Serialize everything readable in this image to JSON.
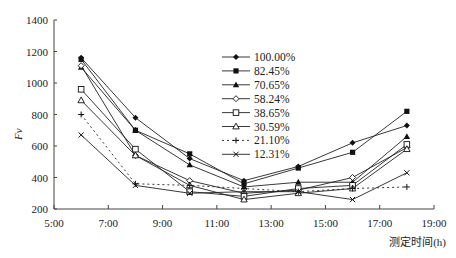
{
  "chart_data": {
    "type": "line",
    "title": "",
    "xlabel": "测定时间(h)",
    "ylabel": "Fv",
    "x_tick_labels": [
      "5:00",
      "7:00",
      "9:00",
      "11:00",
      "13:00",
      "15:00",
      "17:00",
      "19:00"
    ],
    "x_ticks_hours": [
      5,
      7,
      9,
      11,
      13,
      15,
      17,
      19
    ],
    "y_tick_labels": [
      "200",
      "400",
      "600",
      "800",
      "1000",
      "1200",
      "1400"
    ],
    "y_ticks": [
      200,
      400,
      600,
      800,
      1000,
      1200,
      1400
    ],
    "xlim": [
      5,
      19
    ],
    "ylim": [
      200,
      1400
    ],
    "grid": false,
    "legend_position": "upper-center",
    "x": [
      6,
      8,
      10,
      12,
      14,
      16,
      18
    ],
    "x_labels": [
      "6:00",
      "8:00",
      "10:00",
      "12:00",
      "14:00",
      "16:00",
      "18:00"
    ],
    "series": [
      {
        "name": "100.00%",
        "marker": "filled-diamond",
        "dash": "solid",
        "values": [
          1160,
          780,
          520,
          380,
          470,
          620,
          730
        ]
      },
      {
        "name": "82.45%",
        "marker": "filled-square",
        "dash": "solid",
        "values": [
          1150,
          700,
          550,
          360,
          460,
          560,
          820
        ]
      },
      {
        "name": "70.65%",
        "marker": "filled-triangle",
        "dash": "solid",
        "values": [
          1100,
          700,
          480,
          340,
          370,
          370,
          660
        ]
      },
      {
        "name": "58.24%",
        "marker": "open-diamond",
        "dash": "solid",
        "values": [
          1110,
          540,
          380,
          300,
          320,
          400,
          590
        ]
      },
      {
        "name": "38.65%",
        "marker": "open-square",
        "dash": "solid",
        "values": [
          960,
          580,
          310,
          280,
          330,
          350,
          610
        ]
      },
      {
        "name": "30.59%",
        "marker": "open-triangle",
        "dash": "solid",
        "values": [
          890,
          540,
          350,
          260,
          300,
          330,
          580
        ]
      },
      {
        "name": "21.10%",
        "marker": "plus",
        "dash": "dashed",
        "values": [
          800,
          360,
          350,
          330,
          310,
          330,
          340
        ]
      },
      {
        "name": "12.31%",
        "marker": "cross",
        "dash": "solid",
        "values": [
          670,
          350,
          300,
          310,
          310,
          260,
          430
        ]
      }
    ]
  }
}
